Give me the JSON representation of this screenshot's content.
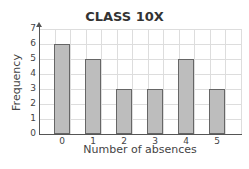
{
  "chart_data": {
    "type": "bar",
    "title": "CLASS 10X",
    "xlabel": "Number of absences",
    "ylabel": "Frequency",
    "categories": [
      "0",
      "1",
      "2",
      "3",
      "4",
      "5"
    ],
    "values": [
      6,
      5,
      3,
      3,
      5,
      3
    ],
    "ylim": [
      0,
      7
    ],
    "yticks": [
      "0",
      "1",
      "2",
      "3",
      "4",
      "5",
      "6",
      "7"
    ],
    "grid": true,
    "bar_color": "#bdbdbd"
  }
}
